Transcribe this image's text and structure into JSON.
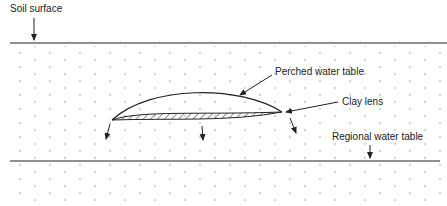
{
  "diagram": {
    "labels": {
      "soil_surface": "Soil surface",
      "perched_water_table": "Perched water table",
      "clay_lens": "Clay lens",
      "regional_water_table": "Regional water table"
    },
    "colors": {
      "line": "#222222",
      "dots": "#888888"
    }
  }
}
